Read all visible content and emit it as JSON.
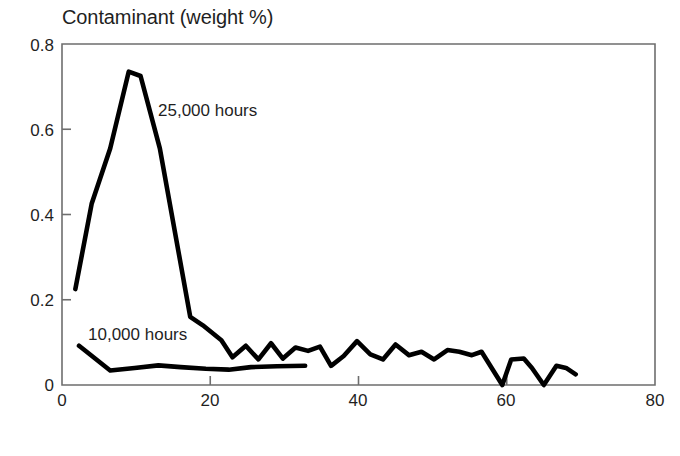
{
  "figure": {
    "title": "Contaminant (weight %)",
    "xlabel": "Washcoat thickness (microns)",
    "series_labels": {
      "s25000": "25,000 hours",
      "s10000": "10,000 hours"
    },
    "ytick_labels": [
      "0.8",
      "0.6",
      "0.4",
      "0.2",
      "0"
    ],
    "xtick_labels": [
      "0",
      "20",
      "40",
      "60",
      "80"
    ],
    "line_color": "#000000",
    "axis_color": "#6e6e6e",
    "background": "#ffffff"
  },
  "chart_data": {
    "type": "line",
    "title": "Contaminant (weight %)",
    "subtitle": "",
    "xlabel": "Washcoat thickness (microns)",
    "ylabel": "Contaminant (weight %)",
    "xlim": [
      0,
      80
    ],
    "ylim": [
      0,
      0.8
    ],
    "xticks": [
      0,
      20,
      40,
      60,
      80
    ],
    "yticks": [
      0,
      0.2,
      0.4,
      0.6,
      0.8
    ],
    "grid": false,
    "legend": "inline-annotations",
    "legend_position": "inside-plot",
    "annotations": [
      {
        "text": "25,000 hours",
        "x": 13.0,
        "y": 0.655
      },
      {
        "text": "10,000 hours",
        "x": 3.5,
        "y": 0.125
      }
    ],
    "series": [
      {
        "name": "25,000 hours",
        "color": "#000000",
        "points": [
          {
            "x": 1.8,
            "y": 0.225
          },
          {
            "x": 4.0,
            "y": 0.425
          },
          {
            "x": 6.5,
            "y": 0.555
          },
          {
            "x": 9.0,
            "y": 0.735
          },
          {
            "x": 10.6,
            "y": 0.725
          },
          {
            "x": 13.2,
            "y": 0.555
          },
          {
            "x": 17.3,
            "y": 0.16
          },
          {
            "x": 19.0,
            "y": 0.14
          },
          {
            "x": 21.5,
            "y": 0.105
          },
          {
            "x": 23.0,
            "y": 0.065
          },
          {
            "x": 24.8,
            "y": 0.092
          },
          {
            "x": 26.5,
            "y": 0.06
          },
          {
            "x": 28.2,
            "y": 0.098
          },
          {
            "x": 29.8,
            "y": 0.062
          },
          {
            "x": 31.5,
            "y": 0.088
          },
          {
            "x": 33.2,
            "y": 0.08
          },
          {
            "x": 34.8,
            "y": 0.09
          },
          {
            "x": 36.3,
            "y": 0.045
          },
          {
            "x": 38.0,
            "y": 0.068
          },
          {
            "x": 39.8,
            "y": 0.103
          },
          {
            "x": 41.6,
            "y": 0.072
          },
          {
            "x": 43.3,
            "y": 0.06
          },
          {
            "x": 45.0,
            "y": 0.095
          },
          {
            "x": 46.8,
            "y": 0.07
          },
          {
            "x": 48.5,
            "y": 0.078
          },
          {
            "x": 50.2,
            "y": 0.06
          },
          {
            "x": 52.0,
            "y": 0.082
          },
          {
            "x": 53.6,
            "y": 0.078
          },
          {
            "x": 55.3,
            "y": 0.07
          },
          {
            "x": 56.6,
            "y": 0.078
          },
          {
            "x": 59.4,
            "y": 0.0
          },
          {
            "x": 60.6,
            "y": 0.06
          },
          {
            "x": 62.3,
            "y": 0.062
          },
          {
            "x": 63.4,
            "y": 0.04
          },
          {
            "x": 65.0,
            "y": 0.0
          },
          {
            "x": 66.7,
            "y": 0.045
          },
          {
            "x": 68.0,
            "y": 0.04
          },
          {
            "x": 69.3,
            "y": 0.025
          }
        ]
      },
      {
        "name": "10,000 hours",
        "color": "#000000",
        "points": [
          {
            "x": 2.3,
            "y": 0.092
          },
          {
            "x": 6.5,
            "y": 0.034
          },
          {
            "x": 9.8,
            "y": 0.04
          },
          {
            "x": 13.0,
            "y": 0.046
          },
          {
            "x": 16.0,
            "y": 0.042
          },
          {
            "x": 19.4,
            "y": 0.038
          },
          {
            "x": 22.5,
            "y": 0.036
          },
          {
            "x": 25.5,
            "y": 0.042
          },
          {
            "x": 29.0,
            "y": 0.044
          },
          {
            "x": 32.8,
            "y": 0.045
          }
        ]
      }
    ]
  }
}
